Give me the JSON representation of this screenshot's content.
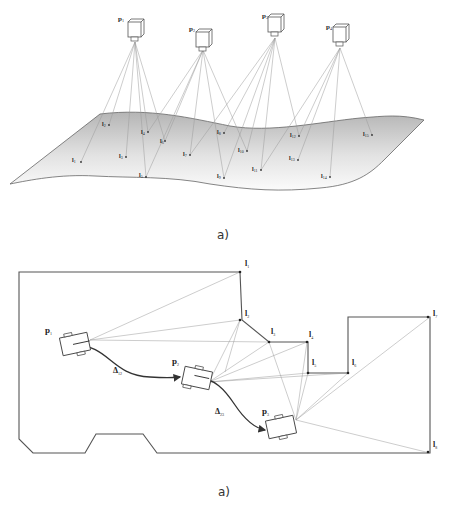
{
  "figure_a": {
    "caption": "a)",
    "cameras": [
      {
        "label": "p",
        "sub": "1",
        "x": 135,
        "y": 25
      },
      {
        "label": "p",
        "sub": "2",
        "x": 203,
        "y": 35
      },
      {
        "label": "p",
        "sub": "3",
        "x": 275,
        "y": 20
      },
      {
        "label": "p",
        "sub": "4",
        "x": 340,
        "y": 30
      }
    ],
    "landmarks": [
      {
        "label": "l",
        "sub": "1",
        "x": 81,
        "y": 162
      },
      {
        "label": "l",
        "sub": "2",
        "x": 109,
        "y": 125
      },
      {
        "label": "l",
        "sub": "3",
        "x": 126,
        "y": 157
      },
      {
        "label": "l",
        "sub": "4",
        "x": 148,
        "y": 132
      },
      {
        "label": "l",
        "sub": "5",
        "x": 146,
        "y": 177
      },
      {
        "label": "l",
        "sub": "6",
        "x": 165,
        "y": 141
      },
      {
        "label": "l",
        "sub": "7",
        "x": 190,
        "y": 155
      },
      {
        "label": "l",
        "sub": "8",
        "x": 224,
        "y": 133
      },
      {
        "label": "l",
        "sub": "9",
        "x": 224,
        "y": 178
      },
      {
        "label": "l",
        "sub": "10",
        "x": 247,
        "y": 151
      },
      {
        "label": "l",
        "sub": "11",
        "x": 261,
        "y": 170
      },
      {
        "label": "l",
        "sub": "12",
        "x": 299,
        "y": 136
      },
      {
        "label": "l",
        "sub": "13",
        "x": 298,
        "y": 160
      },
      {
        "label": "l",
        "sub": "14",
        "x": 330,
        "y": 177
      },
      {
        "label": "l",
        "sub": "15",
        "x": 372,
        "y": 135
      }
    ]
  },
  "figure_b": {
    "caption": "a)",
    "poses": [
      {
        "label": "p",
        "sub": "1"
      },
      {
        "label": "p",
        "sub": "2"
      },
      {
        "label": "p",
        "sub": "3"
      }
    ],
    "motions": [
      {
        "label": "Δ",
        "sub": "12"
      },
      {
        "label": "Δ",
        "sub": "23"
      }
    ],
    "landmarks": [
      {
        "label": "l",
        "sub": "1"
      },
      {
        "label": "l",
        "sub": "2"
      },
      {
        "label": "l",
        "sub": "3"
      },
      {
        "label": "l",
        "sub": "4"
      },
      {
        "label": "l",
        "sub": "5"
      },
      {
        "label": "l",
        "sub": "6"
      },
      {
        "label": "l",
        "sub": "7"
      },
      {
        "label": "l",
        "sub": "8"
      }
    ]
  }
}
